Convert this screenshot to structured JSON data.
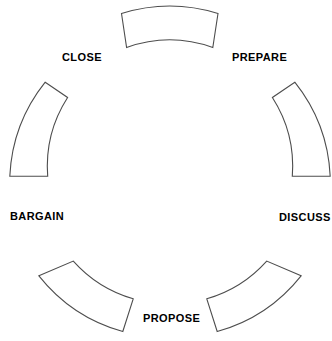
{
  "diagram": {
    "type": "cycle",
    "title": "",
    "segment_count": 6,
    "colors": {
      "background": "#ffffff",
      "segment_fill": "#ffffff",
      "segment_stroke": "#4d4d4d",
      "label_text": "#000000"
    },
    "geometry": {
      "center_x": 170,
      "center_y": 168,
      "outer_radius": 162,
      "inner_radius": 122,
      "gap_degrees": 18
    },
    "stages": [
      {
        "id": "prepare",
        "label": "PREPARE",
        "order": 1,
        "segment_angle_deg": -60,
        "label_x": 232,
        "label_y": 51
      },
      {
        "id": "discuss",
        "label": "DISCUSS",
        "order": 2,
        "segment_angle_deg": 0,
        "label_x": 279,
        "label_y": 211
      },
      {
        "id": "propose",
        "label": "PROPOSE",
        "order": 3,
        "segment_angle_deg": 60,
        "label_x": 143,
        "label_y": 312
      },
      {
        "id": "bargain",
        "label": "BARGAIN",
        "order": 4,
        "segment_angle_deg": 120,
        "label_x": 10,
        "label_y": 210
      },
      {
        "id": "close",
        "label": "CLOSE",
        "order": 5,
        "segment_angle_deg": 180,
        "label_x": 62,
        "label_y": 51
      },
      {
        "id": "top",
        "label": "",
        "order": 6,
        "segment_angle_deg": -120,
        "label_x": 0,
        "label_y": 0
      }
    ],
    "segment_paths": {
      "top": "M 121.0 13.5 L 218.5 13.5 L 213.0 47.2 L 126.5 47.2 Z",
      "upper_right": "M 272.3 97.5 L 295.0 81.9 L 329.5 131.0 L 310.0 146.0 Z",
      "right": "M 310.0 146.0 L 329.5 131.0 L 330.0 176.0 L 292.0 176.0 Z",
      "upper_left": "M 10.5 131.0 L 45.0 81.9 L 67.7 97.5 L 40.0 146.0 Z",
      "left": "M 10.5 131.0 L 40.0 146.0 L 40.0 174.0 L 10.5 174.0 Z",
      "lower_left": "M 38.5 275.5 L 124.5 255.5 L 133.5 299.0 L 58.0 330.0 Z",
      "lower_right": "M 206.0 299.0 L 215.0 255.5 L 301.0 275.5 L 281.5 330.0 Z"
    }
  }
}
